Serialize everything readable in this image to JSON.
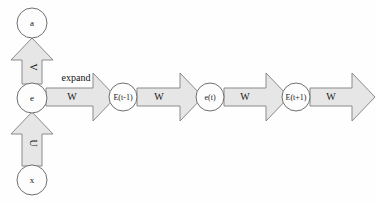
{
  "diagram": {
    "background_color": "#fefefe",
    "shape_fill_color": "#e6e6e6",
    "shape_stroke_color": "#8a8a8a",
    "circle_fill_color": "#fdfdfd",
    "circle_stroke_color": "#6f6f6f",
    "text_color": "#1a1a1a",
    "nodes": [
      {
        "id": "a",
        "label": "a",
        "cx": 32,
        "cy": 23,
        "r": 15
      },
      {
        "id": "e",
        "label": "e",
        "cx": 32,
        "cy": 98,
        "r": 15
      },
      {
        "id": "x",
        "label": "x",
        "cx": 32,
        "cy": 180,
        "r": 15
      },
      {
        "id": "Etm1",
        "label": "E(t-1)",
        "cx": 123,
        "cy": 97,
        "r": 14
      },
      {
        "id": "et",
        "label": "e(t)",
        "cx": 210,
        "cy": 97,
        "r": 14
      },
      {
        "id": "Etp1",
        "label": "E(t+1)",
        "cx": 296,
        "cy": 97,
        "r": 14
      }
    ],
    "vertical_arrows": [
      {
        "id": "e-to-a",
        "label": "V",
        "direction": "up",
        "from": "e",
        "to": "a"
      },
      {
        "id": "x-to-e",
        "label": "U",
        "direction": "up",
        "from": "x",
        "to": "e"
      }
    ],
    "horizontal_arrows": [
      {
        "id": "w1",
        "label": "W",
        "from": "e",
        "to": "Etm1",
        "note": "expand"
      },
      {
        "id": "w2",
        "label": "W",
        "from": "Etm1",
        "to": "et",
        "note": ""
      },
      {
        "id": "w3",
        "label": "W",
        "from": "et",
        "to": "Etp1",
        "note": ""
      },
      {
        "id": "w4",
        "label": "W",
        "from": "Etp1",
        "to": "",
        "note": ""
      }
    ],
    "notes": {
      "expand": "expand"
    }
  }
}
